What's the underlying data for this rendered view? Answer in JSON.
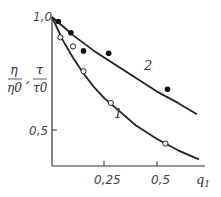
{
  "chart_data": {
    "type": "line",
    "title": "",
    "xlabel": "q1",
    "ylabel": "η/η0 , τ/τ0",
    "ylabel_parts": {
      "eta": "η",
      "eta0": "η0",
      "tau": "τ",
      "tau0": "τ0",
      "sep": ","
    },
    "xlim": [
      0,
      0.72
    ],
    "ylim": [
      0.34,
      1.0
    ],
    "x_ticks": [
      "0,25",
      "0,5"
    ],
    "y_ticks": [
      "0,5",
      "1,0"
    ],
    "grid": false,
    "series": [
      {
        "name": "1",
        "marker": "open-circle",
        "curve": [
          [
            0,
            1.0
          ],
          [
            0.05,
            0.9
          ],
          [
            0.1,
            0.82
          ],
          [
            0.15,
            0.75
          ],
          [
            0.2,
            0.69
          ],
          [
            0.25,
            0.64
          ],
          [
            0.3,
            0.6
          ],
          [
            0.4,
            0.52
          ],
          [
            0.5,
            0.46
          ],
          [
            0.6,
            0.41
          ],
          [
            0.7,
            0.37
          ]
        ],
        "points": [
          [
            0.04,
            0.91
          ],
          [
            0.1,
            0.87
          ],
          [
            0.15,
            0.76
          ],
          [
            0.28,
            0.62
          ],
          [
            0.54,
            0.44
          ]
        ]
      },
      {
        "name": "2",
        "marker": "filled-circle",
        "curve": [
          [
            0,
            1.0
          ],
          [
            0.05,
            0.96
          ],
          [
            0.1,
            0.92
          ],
          [
            0.2,
            0.85
          ],
          [
            0.3,
            0.79
          ],
          [
            0.4,
            0.73
          ],
          [
            0.5,
            0.67
          ],
          [
            0.6,
            0.62
          ],
          [
            0.69,
            0.57
          ]
        ],
        "points": [
          [
            0.03,
            0.98
          ],
          [
            0.09,
            0.93
          ],
          [
            0.15,
            0.85
          ],
          [
            0.27,
            0.84
          ],
          [
            0.55,
            0.68
          ]
        ]
      }
    ],
    "annotations": [
      {
        "text": "1",
        "x": 0.3,
        "y": 0.55
      },
      {
        "text": "2",
        "x": 0.44,
        "y": 0.78
      }
    ]
  }
}
